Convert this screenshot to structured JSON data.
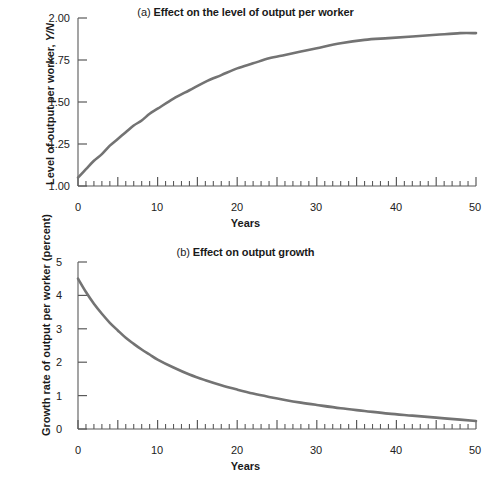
{
  "figure": {
    "panels": [
      {
        "id": "a",
        "tag": "(a)",
        "title": "Effect on the level of output per worker",
        "xlabel": "Years",
        "ylabel_main": "Level of output per worker, ",
        "ylabel_italic": "Y/N",
        "ytick_labels": [
          "2.00",
          "1.75",
          "1.50",
          "1.25",
          "1.00"
        ],
        "xtick_labels": [
          "0",
          "10",
          "20",
          "30",
          "40",
          "50"
        ]
      },
      {
        "id": "b",
        "tag": "(b)",
        "title": "Effect on output growth",
        "xlabel": "Years",
        "ylabel_main": "Growth rate of output per worker (percent)",
        "ylabel_italic": "",
        "ytick_labels": [
          "5",
          "4",
          "3",
          "2",
          "1",
          "0"
        ],
        "xtick_labels": [
          "0",
          "10",
          "20",
          "30",
          "40",
          "50"
        ]
      }
    ],
    "line_color": "#737373",
    "axis_color": "#5a5a5a"
  },
  "chart_data": [
    {
      "type": "line",
      "panel": "(a)",
      "title": "(a) Effect on the level of output per worker",
      "xlabel": "Years",
      "ylabel": "Level of output per worker, Y/N",
      "xlim": [
        0,
        50
      ],
      "ylim": [
        1.0,
        2.0
      ],
      "ytick_values": [
        1.0,
        1.25,
        1.5,
        1.75,
        2.0
      ],
      "xtick_values": [
        0,
        10,
        20,
        30,
        40,
        50
      ],
      "minor_tick_step": 1,
      "major_tick_step": 5,
      "grid": false,
      "legend": null,
      "series": [
        {
          "name": "Output per worker",
          "x": [
            0,
            1,
            2,
            3,
            4,
            5,
            6,
            7,
            8,
            9,
            10,
            12,
            14,
            16,
            18,
            20,
            22,
            24,
            26,
            28,
            30,
            33,
            36,
            39,
            42,
            45,
            48,
            50
          ],
          "y": [
            1.05,
            1.1,
            1.15,
            1.19,
            1.24,
            1.28,
            1.32,
            1.36,
            1.39,
            1.43,
            1.46,
            1.52,
            1.57,
            1.62,
            1.66,
            1.7,
            1.73,
            1.76,
            1.78,
            1.8,
            1.82,
            1.85,
            1.87,
            1.88,
            1.89,
            1.9,
            1.91,
            1.91
          ]
        }
      ]
    },
    {
      "type": "line",
      "panel": "(b)",
      "title": "(b) Effect on output growth",
      "xlabel": "Years",
      "ylabel": "Growth rate of output per worker (percent)",
      "xlim": [
        0,
        50
      ],
      "ylim": [
        0,
        5
      ],
      "ytick_values": [
        0,
        1,
        2,
        3,
        4,
        5
      ],
      "xtick_values": [
        0,
        10,
        20,
        30,
        40,
        50
      ],
      "minor_tick_step": 1,
      "major_tick_step": 5,
      "grid": false,
      "legend": null,
      "series": [
        {
          "name": "Growth rate of output per worker",
          "x": [
            0,
            1,
            2,
            3,
            4,
            5,
            6,
            7,
            8,
            9,
            10,
            12,
            14,
            16,
            18,
            20,
            22,
            24,
            26,
            28,
            30,
            33,
            36,
            39,
            42,
            45,
            48,
            50
          ],
          "y": [
            4.5,
            4.1,
            3.75,
            3.45,
            3.18,
            2.95,
            2.73,
            2.55,
            2.38,
            2.23,
            2.08,
            1.84,
            1.63,
            1.46,
            1.31,
            1.18,
            1.06,
            0.96,
            0.87,
            0.79,
            0.72,
            0.62,
            0.54,
            0.46,
            0.4,
            0.34,
            0.28,
            0.24
          ]
        }
      ]
    }
  ]
}
